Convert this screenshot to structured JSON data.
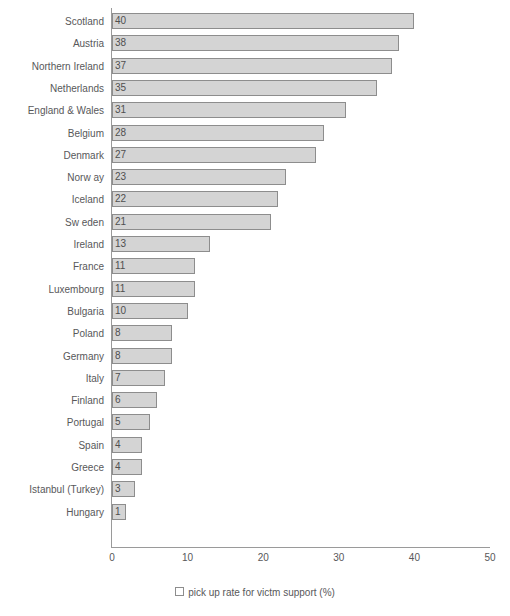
{
  "chart_data": {
    "type": "bar",
    "orientation": "horizontal",
    "title": "",
    "xlabel": "",
    "ylabel": "",
    "xlim": [
      0,
      50
    ],
    "xticks": [
      "0",
      "10",
      "20",
      "30",
      "40",
      "50"
    ],
    "grid": false,
    "legend_position": "bottom",
    "legend": [
      "pick up rate for victm support (%)"
    ],
    "series_name": "pick up rate for victm support (%)",
    "categories": [
      "Scotland",
      "Austria",
      "Northern Ireland",
      "Netherlands",
      "England & Wales",
      "Belgium",
      "Denmark",
      "Norw ay",
      "Iceland",
      "Sw eden",
      "Ireland",
      "France",
      "Luxembourg",
      "Bulgaria",
      "Poland",
      "Germany",
      "Italy",
      "Finland",
      "Portugal",
      "Spain",
      "Greece",
      "Istanbul (Turkey)",
      "Hungary"
    ],
    "values": [
      40,
      38,
      37,
      35,
      31,
      28,
      27,
      23,
      22,
      21,
      13,
      11,
      11,
      10,
      8,
      8,
      7,
      6,
      5,
      4,
      4,
      3,
      1
    ],
    "data_labels": [
      "40",
      "38",
      "37",
      "35",
      "31",
      "28",
      "27",
      "23",
      "22",
      "21",
      "13",
      "11",
      "11",
      "10",
      "8",
      "8",
      "7",
      "6",
      "5",
      "4",
      "4",
      "3",
      "1"
    ]
  },
  "legend": {
    "marker": "open-square-marker",
    "label": "pick up rate for victm support (%)"
  },
  "colors": {
    "bar_fill": "#d4d4d4",
    "bar_border": "#8d8d8d",
    "axis": "#9a9a9a",
    "text": "#58585a",
    "background": "#ffffff"
  }
}
